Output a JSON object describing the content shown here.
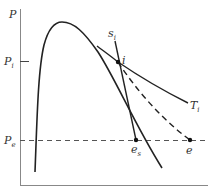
{
  "diagram": {
    "type": "P-h process diagram (turbine expansion)",
    "axes": {
      "y_label": "P",
      "ticks": [
        {
          "label": "P",
          "sub": "i",
          "name": "inlet-pressure"
        },
        {
          "label": "P",
          "sub": "e",
          "name": "exit-pressure"
        }
      ]
    },
    "curves": [
      {
        "name": "saturation-dome",
        "style": "solid"
      },
      {
        "name": "isentrope-si",
        "label": "s",
        "sub": "i",
        "style": "solid"
      },
      {
        "name": "isotherm-Ti",
        "label": "T",
        "sub": "i",
        "style": "solid"
      },
      {
        "name": "actual-process",
        "style": "dashed"
      },
      {
        "name": "exit-pressure-line",
        "style": "dashed"
      }
    ],
    "points": [
      {
        "name": "state-i",
        "label": "i",
        "sub": ""
      },
      {
        "name": "state-es",
        "label": "e",
        "sub": "s"
      },
      {
        "name": "state-e",
        "label": "e",
        "sub": ""
      }
    ]
  }
}
